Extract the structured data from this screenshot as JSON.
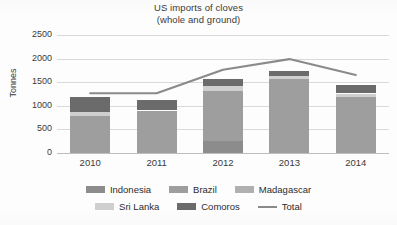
{
  "chart_data": {
    "type": "bar",
    "subtype": "stacked-column-with-line",
    "title": "US imports  of cloves",
    "subtitle": "(whole and ground)",
    "xlabel": "",
    "ylabel": "Tonnes",
    "ylim": [
      0,
      2500
    ],
    "ytick_step": 500,
    "yticks": [
      "2500",
      "2000",
      "1500",
      "1000",
      "500",
      "0"
    ],
    "grid": true,
    "legend_position": "bottom",
    "categories": [
      "2010",
      "2011",
      "2012",
      "2013",
      "2014"
    ],
    "series": [
      {
        "name": "Indonesia",
        "color": "#8c8c8c",
        "values": [
          0,
          0,
          260,
          0,
          0
        ]
      },
      {
        "name": "Brazil",
        "color": "#9e9e9e",
        "values": [
          790,
          900,
          1060,
          1560,
          1185
        ]
      },
      {
        "name": "Madagascar",
        "color": "#b0b0b0",
        "values": [
          0,
          0,
          0,
          0,
          0
        ]
      },
      {
        "name": "Sri Lanka",
        "color": "#cfcfcf",
        "values": [
          75,
          0,
          95,
          75,
          75
        ]
      },
      {
        "name": "Comoros",
        "color": "#6b6b6b",
        "values": [
          320,
          220,
          150,
          105,
          185
        ]
      }
    ],
    "line_series": {
      "name": "Total",
      "color": "#8a8a8a",
      "values": [
        1265,
        1265,
        1765,
        1990,
        1650
      ]
    }
  },
  "legend": {
    "items": [
      {
        "label": "Indonesia",
        "marker": "swatch",
        "color": "#8c8c8c"
      },
      {
        "label": "Brazil",
        "marker": "swatch",
        "color": "#9e9e9e"
      },
      {
        "label": "Madagascar",
        "marker": "swatch",
        "color": "#b0b0b0"
      },
      {
        "label": "Sri Lanka",
        "marker": "swatch",
        "color": "#cfcfcf"
      },
      {
        "label": "Comoros",
        "marker": "swatch",
        "color": "#6b6b6b"
      },
      {
        "label": "Total",
        "marker": "line",
        "color": "#8a8a8a"
      }
    ]
  }
}
